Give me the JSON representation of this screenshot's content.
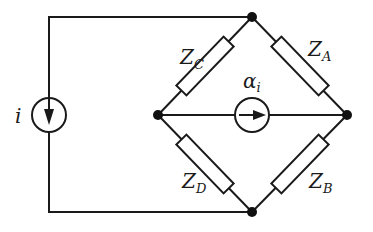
{
  "diagram": {
    "type": "circuit-bridge",
    "nodes": {
      "top": {
        "x": 252,
        "y": 17
      },
      "bottom": {
        "x": 252,
        "y": 212
      },
      "left": {
        "x": 158,
        "y": 115
      },
      "right": {
        "x": 347,
        "y": 115
      }
    },
    "source_independent": {
      "label": "i",
      "kind": "current-source",
      "direction": "down"
    },
    "source_dependent": {
      "label_main": "α",
      "label_sub": "i",
      "kind": "current-controlled-current-source",
      "direction": "right"
    },
    "impedances": [
      {
        "id": "ZA",
        "main": "Z",
        "sub": "A",
        "branch": "top-right"
      },
      {
        "id": "ZB",
        "main": "Z",
        "sub": "B",
        "branch": "right-bottom"
      },
      {
        "id": "ZC",
        "main": "Z",
        "sub": "C",
        "branch": "top-left"
      },
      {
        "id": "ZD",
        "main": "Z",
        "sub": "D",
        "branch": "left-bottom"
      }
    ]
  }
}
